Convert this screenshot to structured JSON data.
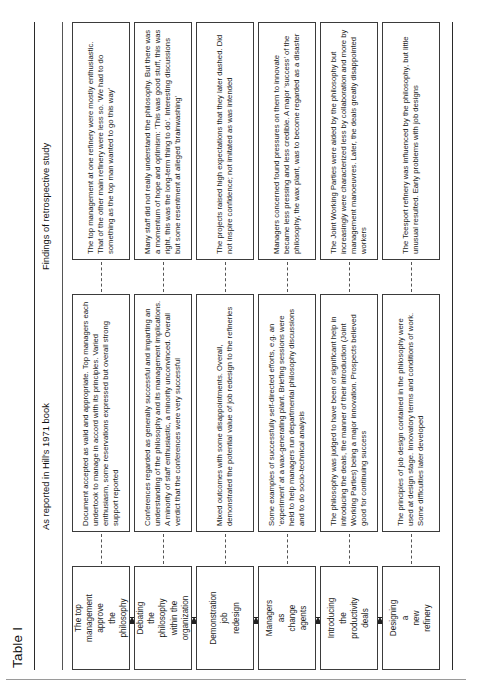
{
  "table": {
    "title": "Table I",
    "columns": {
      "stage": "",
      "book": "As reported in Hill's 1971 book",
      "findings": "Findings of retrospective study"
    },
    "rows": [
      {
        "stage": "The top\nmanagement\napprove\nthe\nphilosophy",
        "book": "Document accepted as valid and appropriate. Top managers each undertook to manage in accord with its principles. Varied enthusiasm, some reservations expressed but overall strong support reported",
        "findings": "The top management at one refinery were mostly enthusiastic. That of the other main refinery were less so. 'We had to do something as the top man wanted to go this way'"
      },
      {
        "stage": "Debating\nthe\nphilosophy\nwithin the\norganization",
        "book": "Conferences regarded as generally successful and imparting an understanding of the philosophy and its management implications. A minority of staff enthusiastic, a minority unconvinced. Overall verdict that the conferences were very successful",
        "findings": "Many staff did not really understand the philosophy. But there was a momentum of hope and optimism: 'This was good stuff, this was right, this was the long-term thing to do'. Interesting discussions but some resentment at alleged 'brainwashing'"
      },
      {
        "stage": "Demonstration\njob\nredesign",
        "book": "Mixed outcomes with some disappointments. Overall, demonstrated the potential value of job redesign to the refineries",
        "findings": "The projects raised high expectations that they later dashed. Did not inspire confidence; not imitated as was intended"
      },
      {
        "stage": "Managers\nas\nchange\nagents",
        "book": "Some examples of successfully self-directed efforts, e.g. an 'experiment' at a wax-generating plant. Briefing sessions were held to help managers run departmental philosophy discussions and to do socio-technical analysis",
        "findings": "Managers concerned found pressures on them to innovate became less pressing and less credible. A major 'success' of the philosophy, the wax plant, was to become regarded as a disaster"
      },
      {
        "stage": "Introducing\nthe\nproductivity\ndeals",
        "book": "The philosophy was judged to have been of significant help in introducing the deals, the manner of their introduction (Joint Working Parties) being a major innovation. Prospects believed good for continuing success",
        "findings": "The Joint Working Parties were aided by the philosophy but increasingly were characterized less by collaboration and more by management manoeuvres. Later, the deals greatly disappointed workers"
      },
      {
        "stage": "Designing\na\nnew\nrefinery",
        "book": "The principles of job design contained in the philosophy were used at design stage. Innovatory terms and conditions of work. Some difficulties later developed",
        "findings": "The Teesport refinery was influenced by the philosophy, but little unusual resulted. Early problems with job designs"
      }
    ]
  }
}
